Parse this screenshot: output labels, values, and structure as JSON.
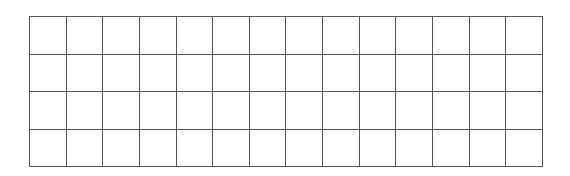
{
  "grid": {
    "rows": 4,
    "columns": 14,
    "line_color": "#555555",
    "background": "#ffffff",
    "cells": []
  }
}
